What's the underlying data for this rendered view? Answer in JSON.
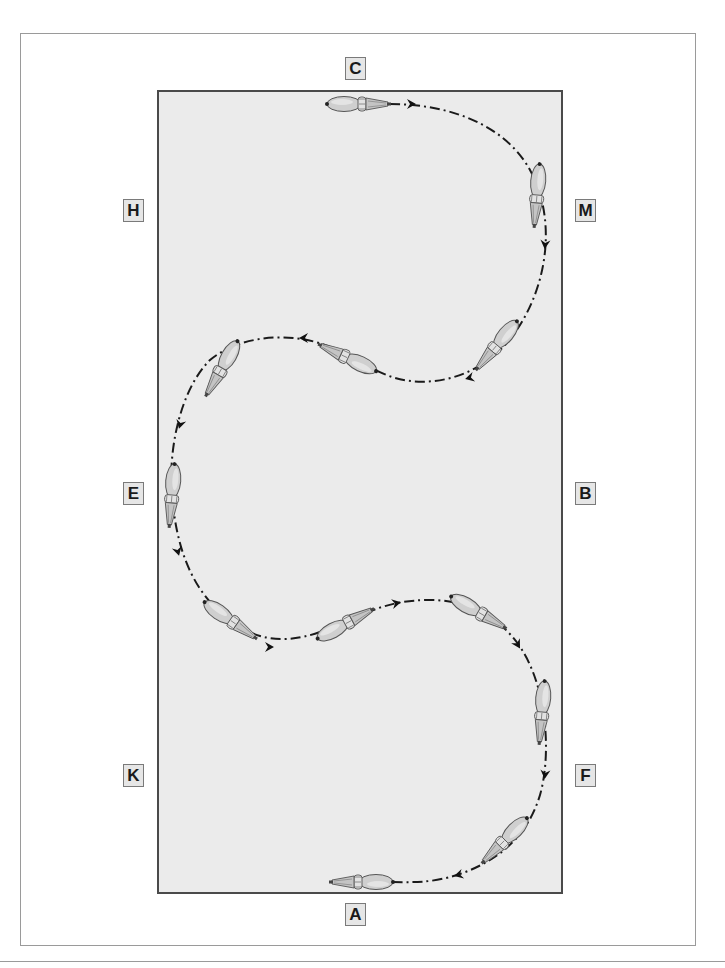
{
  "diagram": {
    "title": "",
    "colors": {
      "arena_fill": "#ebebeb",
      "arena_border": "#4a4a4a",
      "frame": "#9a9a9a",
      "path": "#1a1a1a",
      "horse": "#c8c8c8"
    },
    "markers": [
      {
        "id": "C",
        "label": "C",
        "side": "top"
      },
      {
        "id": "H",
        "label": "H",
        "side": "left"
      },
      {
        "id": "M",
        "label": "M",
        "side": "right"
      },
      {
        "id": "E",
        "label": "E",
        "side": "left"
      },
      {
        "id": "B",
        "label": "B",
        "side": "right"
      },
      {
        "id": "K",
        "label": "K",
        "side": "left"
      },
      {
        "id": "F",
        "label": "F",
        "side": "right"
      },
      {
        "id": "A",
        "label": "A",
        "side": "bottom"
      }
    ],
    "path": {
      "style": "dash-dot",
      "direction_arrows": 11,
      "horse_figures": 12
    }
  }
}
